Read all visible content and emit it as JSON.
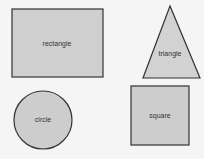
{
  "diagram": {
    "colors": {
      "background": "#f5f5f5",
      "fill": "#cfcfcf",
      "stroke": "#333333"
    },
    "shapes": [
      {
        "id": "rectangle",
        "label": "rectangle"
      },
      {
        "id": "triangle",
        "label": "triangle"
      },
      {
        "id": "circle",
        "label": "circle"
      },
      {
        "id": "square",
        "label": "square"
      }
    ]
  }
}
